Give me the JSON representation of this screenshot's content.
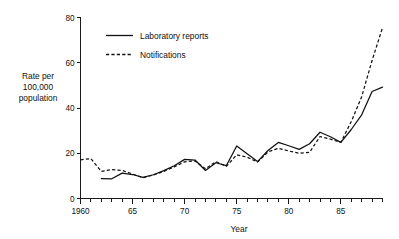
{
  "chart_data": {
    "type": "line",
    "title": "",
    "xlabel": "Year",
    "ylabel": "Rate per 100,000 population",
    "ylabel_lines": [
      "Rate per",
      "100,000",
      "population"
    ],
    "xlim": [
      1960,
      1989
    ],
    "ylim": [
      0,
      80
    ],
    "grid": false,
    "legend_position": "top-left-inside",
    "x_tick_labels": [
      "1960",
      "65",
      "70",
      "75",
      "80",
      "85"
    ],
    "x_tick_values": [
      1960,
      1965,
      1970,
      1975,
      1980,
      1985
    ],
    "x_minor_ticks_every": 1,
    "y_tick_labels": [
      "0",
      "20",
      "40",
      "60",
      "80"
    ],
    "y_tick_values": [
      0,
      20,
      40,
      60,
      80
    ],
    "x": [
      1960,
      1961,
      1962,
      1963,
      1964,
      1965,
      1966,
      1967,
      1968,
      1969,
      1970,
      1971,
      1972,
      1973,
      1974,
      1975,
      1976,
      1977,
      1978,
      1979,
      1980,
      1981,
      1982,
      1983,
      1984,
      1985,
      1986,
      1987,
      1988,
      1989
    ],
    "series": [
      {
        "name": "Laboratory reports",
        "style": "solid",
        "x": [
          1962,
          1963,
          1964,
          1965,
          1966,
          1967,
          1968,
          1969,
          1970,
          1971,
          1972,
          1973,
          1974,
          1975,
          1976,
          1977,
          1978,
          1979,
          1980,
          1981,
          1982,
          1983,
          1984,
          1985,
          1986,
          1987,
          1988,
          1989
        ],
        "values": [
          8.8,
          8.7,
          11.2,
          10.6,
          9.3,
          10.5,
          12.3,
          14.5,
          17.3,
          17.0,
          12.4,
          15.8,
          14.5,
          23.2,
          19.8,
          16.3,
          21.2,
          24.8,
          23.3,
          21.7,
          24.2,
          29.3,
          27.3,
          24.8,
          30.5,
          37.0,
          47.3,
          49.2
        ]
      },
      {
        "name": "Notifications",
        "style": "dashed",
        "x": [
          1960,
          1961,
          1962,
          1963,
          1964,
          1965,
          1966,
          1967,
          1968,
          1969,
          1970,
          1971,
          1972,
          1973,
          1974,
          1975,
          1976,
          1977,
          1978,
          1979,
          1980,
          1981,
          1982,
          1983,
          1984,
          1985,
          1986,
          1987,
          1988,
          1989
        ],
        "values": [
          17.1,
          17.6,
          12.0,
          12.8,
          12.4,
          10.8,
          9.2,
          10.4,
          12.0,
          14.0,
          16.2,
          16.6,
          13.1,
          16.3,
          14.2,
          19.3,
          18.3,
          16.1,
          20.6,
          22.2,
          21.0,
          20.0,
          20.4,
          27.4,
          26.2,
          24.8,
          34.0,
          45.0,
          61.0,
          75.5
        ]
      }
    ]
  },
  "legend": {
    "items": [
      {
        "label": "Laboratory reports",
        "style": "solid"
      },
      {
        "label": "Notifications",
        "style": "dashed"
      }
    ]
  }
}
